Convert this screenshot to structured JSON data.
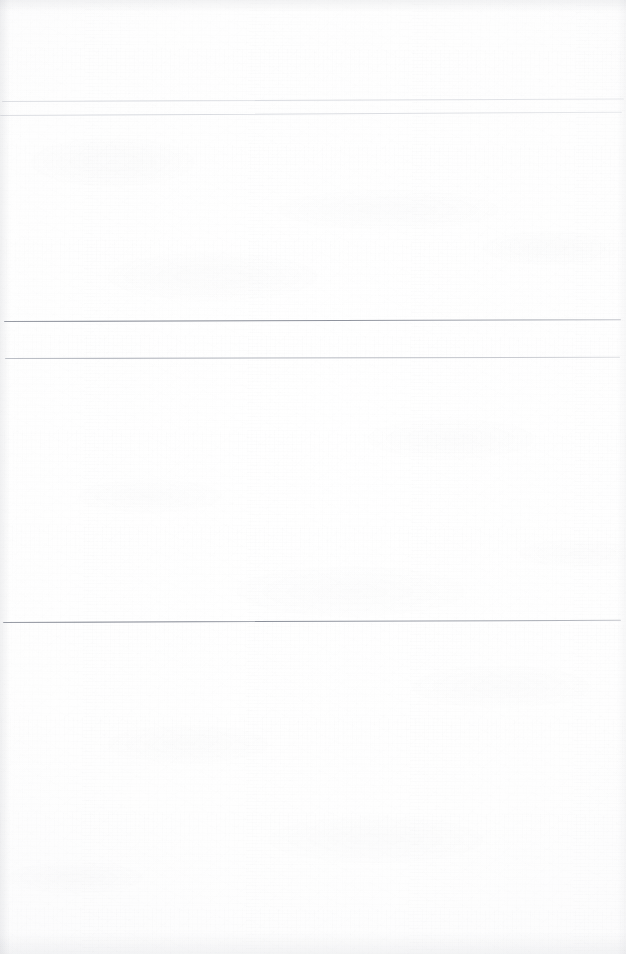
{
  "document": {
    "kind": "scanned-page",
    "page_label": "",
    "visible_text": "",
    "background_color": "#fdfdfd",
    "ink_color": "#7a7f8b",
    "width_px": 626,
    "height_px": 954
  },
  "rules": [
    {
      "name": "rule-top-upper",
      "y": 101,
      "x_start": 2,
      "x_end": 624,
      "thickness": 1,
      "tilt_deg": -0.22,
      "weight": "faint"
    },
    {
      "name": "rule-top-lower",
      "y": 115,
      "x_start": 0,
      "x_end": 622,
      "thickness": 1,
      "tilt_deg": -0.3,
      "weight": "faint"
    },
    {
      "name": "rule-band-top",
      "y": 321,
      "x_start": 4,
      "x_end": 621,
      "thickness": 1,
      "tilt_deg": -0.16,
      "weight": "strong"
    },
    {
      "name": "rule-band-bottom",
      "y": 358,
      "x_start": 5,
      "x_end": 620,
      "thickness": 1,
      "tilt_deg": -0.12,
      "weight": "medium"
    },
    {
      "name": "rule-lower",
      "y": 622,
      "x_start": 3,
      "x_end": 621,
      "thickness": 1,
      "tilt_deg": -0.2,
      "weight": "strong"
    }
  ],
  "regions": [
    {
      "name": "region-header",
      "label": "",
      "y_start": 0,
      "y_end": 101
    },
    {
      "name": "region-upper-body",
      "label": "",
      "y_start": 115,
      "y_end": 321
    },
    {
      "name": "region-band",
      "label": "",
      "y_start": 321,
      "y_end": 358
    },
    {
      "name": "region-mid-body",
      "label": "",
      "y_start": 358,
      "y_end": 622
    },
    {
      "name": "region-lower-body",
      "label": "",
      "y_start": 622,
      "y_end": 954
    }
  ]
}
